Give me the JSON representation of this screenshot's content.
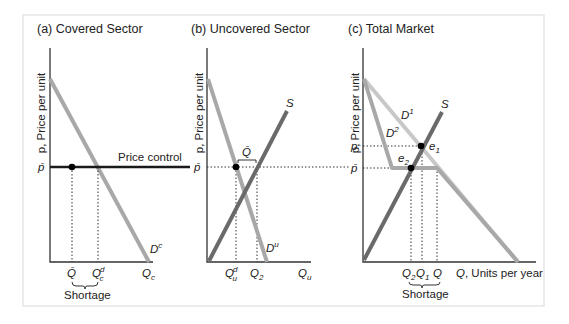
{
  "figure": {
    "frame": {
      "x": 23,
      "y": 15,
      "w": 521,
      "h": 291
    },
    "colors": {
      "demand_light": "#a8a8a8",
      "demand_lighter": "#c8c8c8",
      "supply_dark": "#6a6a6a",
      "control": "#1a1a1a",
      "axis": "#333333",
      "point": "#000000"
    }
  },
  "panels": [
    {
      "id": "a",
      "title": "(a) Covered Sector",
      "y_axis_label": "p, Price per unit",
      "x_axis_end_label": "Q_c",
      "price_label": "p̄",
      "price_control_label": "Price control",
      "curve_labels": {
        "demand": "D",
        "demand_sup": "c"
      },
      "tick_labels": {
        "qbar": "Q̄",
        "qcd": "Q",
        "qcd_sup": "d",
        "qcd_sub": "c",
        "qc": "Q",
        "qc_sub": "c"
      },
      "shortage_label": "Shortage"
    },
    {
      "id": "b",
      "title": "(b) Uncovered Sector",
      "y_axis_label": "p, Price per unit",
      "price_label": "p̄",
      "curve_labels": {
        "supply": "S",
        "demand": "D",
        "demand_sup": "u"
      },
      "bracket_label": "Q̄",
      "tick_labels": {
        "qud": "Q",
        "qud_sup": "d",
        "qud_sub": "u",
        "q2": "Q",
        "q2_sub": "2",
        "qu": "Q",
        "qu_sub": "u"
      }
    },
    {
      "id": "c",
      "title": "(c) Total Market",
      "y_axis_label": "p, Price per unit",
      "price_labels": {
        "p": "p",
        "pbar": "p̄"
      },
      "curve_labels": {
        "supply": "S",
        "d1": "D",
        "d1_sup": "1",
        "d2": "D",
        "d2_sup": "2"
      },
      "point_labels": {
        "e1": "e",
        "e1_sub": "1",
        "e2": "e",
        "e2_sub": "2"
      },
      "tick_labels": {
        "q2": "Q",
        "q2_sub": "2",
        "q1": "Q",
        "q1_sub": "1",
        "q": "Q"
      },
      "x_axis_label": "Q, Units per year",
      "x_axis_label_q": "Q",
      "x_axis_label_rest": ", Units per year",
      "shortage_label": "Shortage"
    }
  ]
}
